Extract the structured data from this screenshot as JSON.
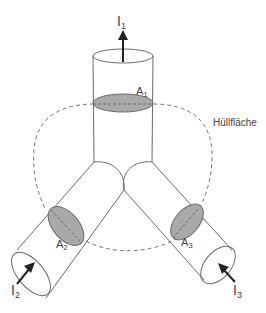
{
  "diagram": {
    "type": "node-current-law",
    "surface_label": "Hüllfläche",
    "conductors": [
      {
        "id": "1",
        "current_label": "I",
        "current_sub": "1",
        "area_label": "A",
        "area_sub": "1",
        "direction": "out"
      },
      {
        "id": "2",
        "current_label": "I",
        "current_sub": "2",
        "area_label": "A",
        "area_sub": "2",
        "direction": "in"
      },
      {
        "id": "3",
        "current_label": "I",
        "current_sub": "3",
        "area_label": "A",
        "area_sub": "3",
        "direction": "in"
      }
    ],
    "colors": {
      "line": "#6a6a6a",
      "area_fill": "#a9a9a9",
      "arrow": "#222222",
      "text": "#444444"
    }
  }
}
